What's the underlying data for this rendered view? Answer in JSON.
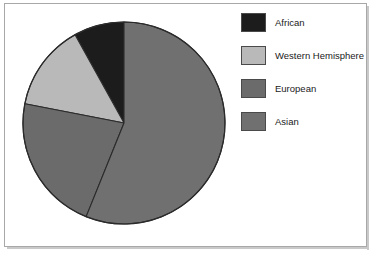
{
  "chart_data": {
    "type": "pie",
    "title": "",
    "subtitle": "",
    "xlabel": "",
    "ylabel": "",
    "legend_position": "right",
    "grid": false,
    "categories": [
      "African",
      "Western Hemisphere",
      "European",
      "Asian"
    ],
    "values": [
      9,
      14,
      22,
      55
    ],
    "unit": "percent",
    "slices": [
      {
        "label": "African",
        "value": 9,
        "color": "#1c1c1c",
        "start_angle_deg": 331,
        "end_angle_deg": 360
      },
      {
        "label": "Western Hemisphere",
        "value": 14,
        "color": "#b9b9b9",
        "start_angle_deg": 281,
        "end_angle_deg": 331
      },
      {
        "label": "European",
        "value": 22,
        "color": "#6b6b6b",
        "start_angle_deg": 202,
        "end_angle_deg": 281
      },
      {
        "label": "Asian",
        "value": 55,
        "color": "#707070",
        "start_angle_deg": 0,
        "end_angle_deg": 202
      }
    ],
    "geometry": {
      "center_x": 106,
      "center_y": 106,
      "radius": 101,
      "start_at_twelve_oclock": true,
      "direction": "clockwise"
    }
  },
  "legend": {
    "items": [
      {
        "label": "African",
        "color": "#1c1c1c"
      },
      {
        "label": "Western Hemisphere",
        "color": "#b9b9b9"
      },
      {
        "label": "European",
        "color": "#6b6b6b"
      },
      {
        "label": "Asian",
        "color": "#707070"
      }
    ]
  },
  "frame": {
    "border_color": "#a8a8a8",
    "background": "#ffffff",
    "slice_outline_color": "#2b2b2b"
  }
}
